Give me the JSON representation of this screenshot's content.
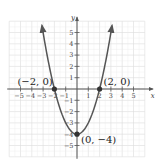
{
  "chart_data": {
    "type": "line",
    "title": "",
    "xlabel": "x",
    "ylabel": "y",
    "xlim": [
      -6,
      6
    ],
    "ylim": [
      -6,
      6
    ],
    "grid": true,
    "legend": null,
    "x_ticks": [
      -5,
      -4,
      -3,
      -2,
      -1,
      1,
      2,
      3,
      4,
      5
    ],
    "y_ticks": [
      5,
      4,
      3,
      2,
      1,
      -1,
      -2,
      -3,
      -4,
      -5
    ],
    "x_tick_labels": [
      "−5",
      "−4",
      "−3",
      "−2",
      "−1",
      "1",
      "2",
      "3",
      "4",
      "5"
    ],
    "y_tick_labels": [
      "5",
      "4",
      "3",
      "2",
      "1",
      "−1",
      "−2",
      "−3",
      "−4",
      "−5"
    ],
    "series": [
      {
        "name": "parabola",
        "equation": "y = x^2 - 4",
        "x": [
          -3.1,
          -3,
          -2.5,
          -2,
          -1.5,
          -1,
          -0.5,
          0,
          0.5,
          1,
          1.5,
          2,
          2.5,
          3,
          3.1
        ],
        "y": [
          5.61,
          5,
          2.25,
          0,
          -1.75,
          -3,
          -3.75,
          -4,
          -3.75,
          -3,
          -1.75,
          0,
          2.25,
          5,
          5.61
        ],
        "arrows_at_ends": true,
        "color": "#555555"
      }
    ],
    "points": [
      {
        "x": -2,
        "y": 0,
        "label": "(−2, 0)"
      },
      {
        "x": 2,
        "y": 0,
        "label": "(2, 0)"
      },
      {
        "x": 0,
        "y": -4,
        "label": "(0, −4)"
      }
    ]
  },
  "colors": {
    "grid": "#dcdcdc",
    "axis": "#555555",
    "curve": "#555555",
    "points": "#333333",
    "text": "#333333"
  }
}
